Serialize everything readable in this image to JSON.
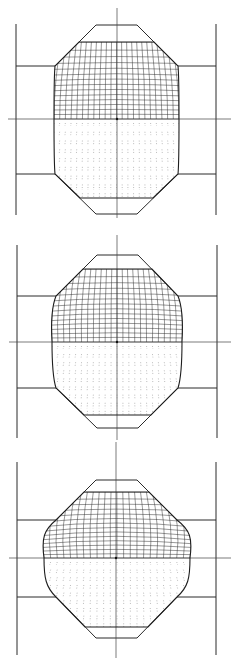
{
  "caption": {
    "text": "",
    "note": "partially cropped, illegible"
  },
  "figures": [
    {
      "id": "stage-1",
      "frame": {
        "left_x": 16,
        "right_x": 216,
        "top_y": 24,
        "bottom_y": 215
      },
      "axis": {
        "y": 119,
        "center_x": 117,
        "x_from": 8,
        "x_to": 231,
        "v_from": 8,
        "v_to": 218
      },
      "die": {
        "flat_left": 96,
        "flat_right": 137,
        "top_y": 25,
        "bottom_y": 214,
        "shoulder_top_y": 66,
        "shoulder_bottom_y": 174,
        "chamfer_left": 55,
        "chamfer_right": 178
      },
      "billet": {
        "top_y": 42,
        "bottom_y": 198,
        "left_x": 54,
        "right_x": 179,
        "bulge": 0
      }
    },
    {
      "id": "stage-2",
      "frame": {
        "left_x": 17,
        "right_x": 217,
        "top_y": 245,
        "bottom_y": 438
      },
      "axis": {
        "y": 342,
        "center_x": 117,
        "x_from": 9,
        "x_to": 231,
        "v_from": 235,
        "v_to": 440
      },
      "die": {
        "flat_left": 97,
        "flat_right": 138,
        "top_y": 255,
        "bottom_y": 428,
        "shoulder_top_y": 296,
        "shoulder_bottom_y": 388,
        "chamfer_left": 56,
        "chamfer_right": 178
      },
      "billet": {
        "top_y": 269,
        "bottom_y": 415,
        "left_x": 52,
        "right_x": 182,
        "bulge": 4
      }
    },
    {
      "id": "stage-3",
      "frame": {
        "left_x": 17,
        "right_x": 216,
        "top_y": 462,
        "bottom_y": 655
      },
      "axis": {
        "y": 558,
        "center_x": 116,
        "x_from": 9,
        "x_to": 231,
        "v_from": 442,
        "v_to": 658
      },
      "die": {
        "flat_left": 96,
        "flat_right": 137,
        "top_y": 480,
        "bottom_y": 638,
        "shoulder_top_y": 520,
        "shoulder_bottom_y": 597,
        "chamfer_left": 56,
        "chamfer_right": 177
      },
      "billet": {
        "top_y": 492,
        "bottom_y": 627,
        "left_x": 44,
        "right_x": 190,
        "bulge": 9
      }
    }
  ]
}
